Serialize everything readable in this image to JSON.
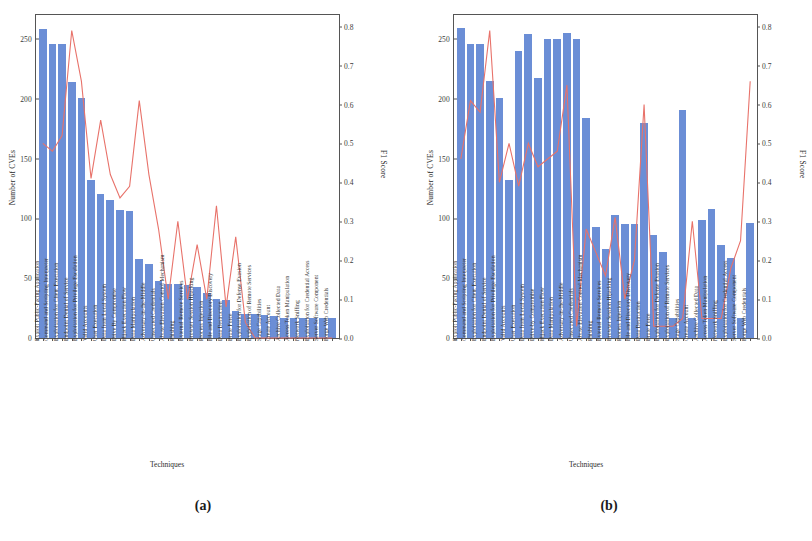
{
  "figure": {
    "panels": [
      {
        "caption": "(a)",
        "xlabel": "Techniques",
        "ylabel_left": "Number of CVEs",
        "ylabel_right": "F1 Score"
      },
      {
        "caption": "(b)",
        "xlabel": "Techniques",
        "ylabel_left": "Number of CVEs",
        "ylabel_right": "F1 Score"
      }
    ]
  },
  "chart_data": [
    {
      "type": "bar",
      "panel": "(a)",
      "title": "",
      "xlabel": "Techniques",
      "ylabel": "Number of CVEs",
      "y2label": "F1 Score",
      "ylim": [
        0,
        270
      ],
      "y2lim": [
        0,
        0.83
      ],
      "yticks": [
        0,
        50,
        100,
        150,
        200,
        250
      ],
      "y2ticks": [
        0.0,
        0.1,
        0.2,
        0.3,
        0.4,
        0.5,
        0.6,
        0.7,
        0.8
      ],
      "grid": false,
      "legend": "none",
      "categories": [
        "Exploit Public-Facing Application",
        "Command and Scripting Interpreter",
        "Exploitation for Client Execution",
        "Endpoint Denial of Service",
        "Exploitation for Privilege Escalation",
        "Valid Accounts",
        "User Execution",
        "Data from Local System",
        "Drive By Compromise",
        "Hijack Execution Flow",
        "Data Manipulation",
        "Adversary-in-the-Middle",
        "Unsecured Credentials",
        "Abuse Elevation Control Mechanism",
        "Phishing",
        "External Remote Services",
        "Browser Session Hijacking",
        "Process Injection",
        "File and Directory Discovery",
        "Data Destruction",
        "Brute Force",
        "Exploitation for Defense Evasion",
        "Exploitation of Remote Services",
        "Stage Capabilities",
        "Create Account",
        "Archive Collected Data",
        "Access Token Manipulation",
        "Network Sniffing",
        "Exploitation for Credential Access",
        "Server Software Component",
        "Forge Web Credentials"
      ],
      "series": [
        {
          "name": "Number of CVEs",
          "kind": "bar",
          "axis": "left",
          "color": "#6b8ed6",
          "values": [
            258,
            246,
            246,
            214,
            201,
            132,
            120,
            115,
            107,
            106,
            66,
            62,
            48,
            45,
            45,
            44,
            43,
            38,
            33,
            32,
            23,
            20,
            20,
            19,
            18,
            17,
            17,
            17,
            17,
            17,
            17
          ]
        },
        {
          "name": "F1 Score",
          "kind": "line",
          "axis": "right",
          "color": "#e8726a",
          "values": [
            0.5,
            0.48,
            0.52,
            0.79,
            0.66,
            0.41,
            0.56,
            0.42,
            0.36,
            0.39,
            0.61,
            0.42,
            0.28,
            0.1,
            0.3,
            0.1,
            0.24,
            0.1,
            0.34,
            0.08,
            0.26,
            0.04,
            0.0,
            0.0,
            0.0,
            0.0,
            0.0,
            0.0,
            0.0,
            0.0,
            0.0
          ]
        }
      ]
    },
    {
      "type": "bar",
      "panel": "(b)",
      "title": "",
      "xlabel": "Techniques",
      "ylabel": "Number of CVEs",
      "y2label": "F1 Score",
      "ylim": [
        0,
        270
      ],
      "y2lim": [
        0,
        0.83
      ],
      "yticks": [
        0,
        50,
        100,
        150,
        200,
        250
      ],
      "y2ticks": [
        0.0,
        0.1,
        0.2,
        0.3,
        0.4,
        0.5,
        0.6,
        0.7,
        0.8
      ],
      "grid": false,
      "legend": "none",
      "categories": [
        "Exploit Public-Facing Application",
        "Command and Scripting Interpreter",
        "Exploitation for Client Execution",
        "Endpoint Denial of Service",
        "Exploitation for Privilege Escalation",
        "Valid Accounts",
        "User Execution",
        "Data from Local System",
        "Drive-by Compromise",
        "Hijack Execution Flow",
        "Data Manipulation",
        "Adversary-in-the-Middle",
        "Unsecured Credentials",
        "Abuse Elevation Control Mechanism",
        "Phishing",
        "External Remote Services",
        "Browser Session Hijacking",
        "Process Injection",
        "File and Directory Discovery",
        "Data Destruction",
        "Brute Force",
        "Exploitation for Defense Evasion",
        "Exploitation of Remote Services",
        "Stage Capabilities",
        "Create Account",
        "Archive Collected Data",
        "Access Token Manipulation",
        "Network Sniffing",
        "Exploitation for Credential Access",
        "Server Software Component",
        "Forge Web Credentials"
      ],
      "series": [
        {
          "name": "Number of CVEs",
          "kind": "bar",
          "axis": "left",
          "color": "#6b8ed6",
          "values": [
            259,
            246,
            246,
            215,
            201,
            132,
            240,
            254,
            217,
            250,
            250,
            255,
            250,
            184,
            93,
            74,
            103,
            95,
            95,
            180,
            86,
            72,
            17,
            191,
            17,
            99,
            108,
            78,
            67,
            17,
            96
          ]
        },
        {
          "name": "F1 Score",
          "kind": "line",
          "axis": "right",
          "color": "#e8726a",
          "values": [
            0.46,
            0.61,
            0.58,
            0.79,
            0.4,
            0.5,
            0.39,
            0.5,
            0.44,
            0.46,
            0.48,
            0.65,
            0.03,
            0.28,
            0.22,
            0.16,
            0.31,
            0.1,
            0.2,
            0.6,
            0.03,
            0.03,
            0.03,
            0.05,
            0.3,
            0.05,
            0.05,
            0.05,
            0.18,
            0.25,
            0.66
          ]
        }
      ]
    }
  ]
}
